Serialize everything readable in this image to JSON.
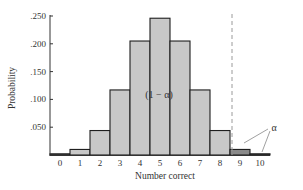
{
  "chart_data": {
    "type": "bar",
    "title": "",
    "xlabel": "Number correct",
    "ylabel": "Probability",
    "categories": [
      "0",
      "1",
      "2",
      "3",
      "4",
      "5",
      "6",
      "7",
      "8",
      "9",
      "10"
    ],
    "values": [
      0.001,
      0.01,
      0.044,
      0.117,
      0.205,
      0.246,
      0.205,
      0.117,
      0.044,
      0.01,
      0.001
    ],
    "yticks": [
      ".050",
      ".100",
      ".150",
      ".200",
      ".250"
    ],
    "ytick_values": [
      0.05,
      0.1,
      0.15,
      0.2,
      0.25
    ],
    "ylim": [
      0,
      0.25
    ],
    "grid": false,
    "legend": null,
    "critical_line": {
      "position": 8.5,
      "style": "dashed"
    },
    "regions": [
      {
        "name": "acceptance",
        "categories": [
          "0",
          "1",
          "2",
          "3",
          "4",
          "5",
          "6",
          "7",
          "8"
        ],
        "label": "(1 − α)"
      },
      {
        "name": "rejection",
        "categories": [
          "9",
          "10"
        ],
        "label": "α"
      }
    ],
    "annotations": [
      {
        "text": "(1 − α)",
        "x": 5,
        "y": 0.1
      },
      {
        "text": "α",
        "x": 10.5,
        "y": 0.045,
        "arrows_to": [
          "9",
          "10"
        ]
      }
    ],
    "colors": {
      "bar_fill": "#c8c8c8",
      "rejection_fill": "#8a8a8a",
      "bar_stroke": "#1e1e1e",
      "axis": "#333333",
      "dashed_line": "#9a9a9a"
    }
  }
}
